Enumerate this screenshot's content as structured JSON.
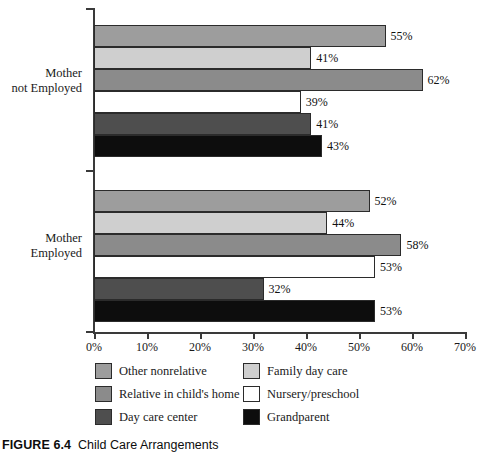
{
  "caption": {
    "figure_number": "FIGURE 6.4",
    "title": "Child Care Arrangements"
  },
  "chart_data": {
    "type": "bar",
    "orientation": "horizontal",
    "title": "Child Care Arrangements",
    "xlabel": "",
    "ylabel": "",
    "xlim": [
      0,
      70
    ],
    "grid": false,
    "legend_position": "bottom",
    "categories": [
      "Mother not Employed",
      "Mother Employed"
    ],
    "category_labels": [
      [
        "Mother",
        "not Employed"
      ],
      [
        "Mother",
        "Employed"
      ]
    ],
    "xticks": [
      0,
      10,
      20,
      30,
      40,
      50,
      60,
      70
    ],
    "xtick_labels": [
      "0%",
      "10%",
      "20%",
      "30%",
      "40%",
      "50%",
      "60%",
      "70%"
    ],
    "series": [
      {
        "name": "Other nonrelative",
        "color": "#9d9d9d",
        "values": [
          55,
          52
        ],
        "value_labels": [
          "55%",
          "52%"
        ]
      },
      {
        "name": "Family day care",
        "color": "#cfcfcf",
        "values": [
          41,
          44
        ],
        "value_labels": [
          "41%",
          "44%"
        ]
      },
      {
        "name": "Relative in child's home",
        "color": "#8b8b8b",
        "values": [
          62,
          58
        ],
        "value_labels": [
          "62%",
          "58%"
        ]
      },
      {
        "name": "Nursery/preschool",
        "color": "#ffffff",
        "values": [
          39,
          53
        ],
        "value_labels": [
          "39%",
          "53%"
        ]
      },
      {
        "name": "Day care center",
        "color": "#4e4e4e",
        "values": [
          41,
          32
        ],
        "value_labels": [
          "41%",
          "32%"
        ]
      },
      {
        "name": "Grandparent",
        "color": "#0d0d0d",
        "values": [
          43,
          53
        ],
        "value_labels": [
          "43%",
          "53%"
        ]
      }
    ],
    "legend_order": [
      "Other nonrelative",
      "Family day care",
      "Relative in child's home",
      "Nursery/preschool",
      "Day care center",
      "Grandparent"
    ]
  }
}
